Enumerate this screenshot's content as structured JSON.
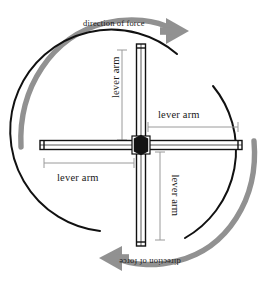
{
  "figure": {
    "background_color": "#ffffff",
    "stroke_color": "#000000",
    "arrow_color": "#8c8c8c",
    "dimension_color": "#9a9a9a",
    "hub_color": "#1a1a1a"
  },
  "labels": {
    "force_top": "direction of force",
    "force_bottom": "direction of force",
    "lever_top": "lever arm",
    "lever_right": "lever arm",
    "lever_bottom": "lever arm",
    "lever_left": "lever arm"
  },
  "icons": {
    "arrow_top": "curved-arrow-clockwise-icon",
    "arrow_bottom": "curved-arrow-clockwise-icon",
    "hub": "hub-pivot-icon",
    "wheel": "circle-outline-icon"
  },
  "geometry": {
    "center": {
      "x": 141,
      "y": 145
    },
    "wheel_radius": 101,
    "bar_half_length": 101,
    "bar_thickness": 9,
    "hub_radius": 8
  },
  "dimensions": [
    {
      "name": "lever-arm-top",
      "orientation": "vertical",
      "from_center": true,
      "length": 95
    },
    {
      "name": "lever-arm-right",
      "orientation": "horizontal",
      "from_center": true,
      "length": 95
    },
    {
      "name": "lever-arm-bottom",
      "orientation": "vertical",
      "from_center": true,
      "length": 95
    },
    {
      "name": "lever-arm-left",
      "orientation": "horizontal",
      "from_center": true,
      "length": 95
    }
  ]
}
